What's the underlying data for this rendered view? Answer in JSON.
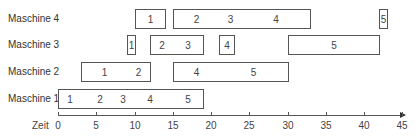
{
  "chart_data": {
    "type": "gantt",
    "title": "",
    "xlabel": "Zeit",
    "ylabel": "",
    "xlim": [
      0,
      45
    ],
    "x_ticks": [
      0,
      5,
      10,
      15,
      20,
      25,
      30,
      35,
      40,
      45
    ],
    "grid": false,
    "rows": [
      {
        "name": "Maschine 4",
        "tasks": [
          {
            "label": "1",
            "start": 10,
            "end": 14
          },
          {
            "label": "2",
            "start": 15,
            "end": 21
          },
          {
            "label": "3",
            "start": 21,
            "end": 24
          },
          {
            "label": "4",
            "start": 24,
            "end": 33
          },
          {
            "label": "5",
            "start": 42,
            "end": 43
          }
        ]
      },
      {
        "name": "Maschine 3",
        "tasks": [
          {
            "label": "1",
            "start": 9,
            "end": 10
          },
          {
            "label": "2",
            "start": 12,
            "end": 15
          },
          {
            "label": "3",
            "start": 15,
            "end": 19
          },
          {
            "label": "4",
            "start": 21,
            "end": 23
          },
          {
            "label": "5",
            "start": 30,
            "end": 42
          }
        ]
      },
      {
        "name": "Maschine 2",
        "tasks": [
          {
            "label": "1",
            "start": 3,
            "end": 9
          },
          {
            "label": "2",
            "start": 9,
            "end": 12
          },
          {
            "label": "4",
            "start": 15,
            "end": 21
          },
          {
            "label": "5",
            "start": 21,
            "end": 30
          }
        ]
      },
      {
        "name": "Maschine 1",
        "tasks": [
          {
            "label": "1",
            "start": 0,
            "end": 3
          },
          {
            "label": "2",
            "start": 3,
            "end": 8
          },
          {
            "label": "3",
            "start": 8,
            "end": 9
          },
          {
            "label": "4",
            "start": 9,
            "end": 15
          },
          {
            "label": "5",
            "start": 15,
            "end": 19
          }
        ]
      }
    ]
  },
  "layout": {
    "origin_x": 58,
    "px_per_unit": 7.65,
    "row_tops": [
      9,
      35,
      62,
      89
    ],
    "bar_height": 20
  }
}
